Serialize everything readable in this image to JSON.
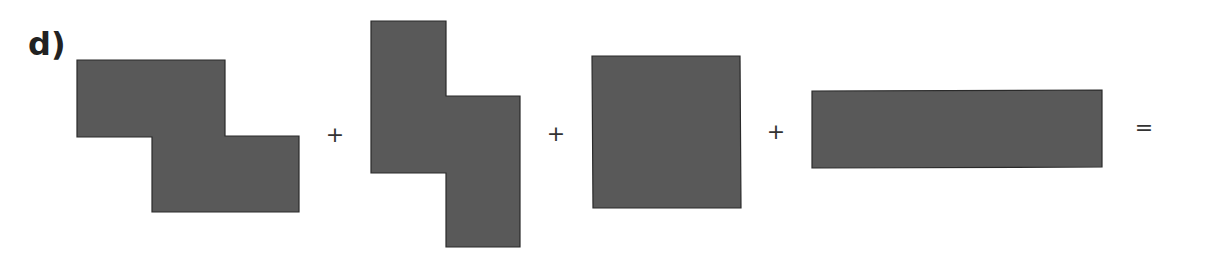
{
  "problem": {
    "label": "d)",
    "shape_fill": "#595959",
    "shape_stroke": "#2a2a2a",
    "operators": [
      {
        "symbol": "+",
        "x": 335,
        "y": 135
      },
      {
        "symbol": "+",
        "x": 556,
        "y": 134
      },
      {
        "symbol": "+",
        "x": 776,
        "y": 132
      },
      {
        "symbol": "=",
        "x": 1144,
        "y": 128
      }
    ],
    "shapes": [
      {
        "name": "z-shape-horizontal",
        "points": "77,60 225,60 225,136 299,136 299,212 152,212 152,137 77,137"
      },
      {
        "name": "s-shape-vertical",
        "points": "371,21 446,21 446,96 520,96 520,247 446,247 446,173 371,173"
      },
      {
        "name": "square",
        "points": "592,56 740,56 741,208 593,208"
      },
      {
        "name": "long-rectangle",
        "points": "812,91 1102,90 1102,167 812,168"
      }
    ]
  }
}
